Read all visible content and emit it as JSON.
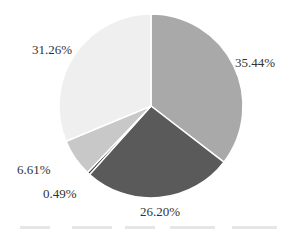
{
  "chart_data": {
    "type": "pie",
    "title": "",
    "start_angle_deg": 0,
    "direction": "clockwise",
    "slices": [
      {
        "label": "35.44%",
        "value": 35.44,
        "color": "#a9a9a9"
      },
      {
        "label": "26.20%",
        "value": 26.2,
        "color": "#5a5a5a"
      },
      {
        "label": "0.49%",
        "value": 0.49,
        "color": "#3a3a3a"
      },
      {
        "label": "6.61%",
        "value": 6.61,
        "color": "#c8c8c8"
      },
      {
        "label": "31.26%",
        "value": 31.26,
        "color": "#efefef"
      }
    ],
    "legend": {
      "position": "bottom",
      "text": "",
      "legible": false
    }
  },
  "labels": {
    "s0": "35.44%",
    "s1": "26.20%",
    "s2": "0.49%",
    "s3": "6.61%",
    "s4": "31.26%"
  }
}
